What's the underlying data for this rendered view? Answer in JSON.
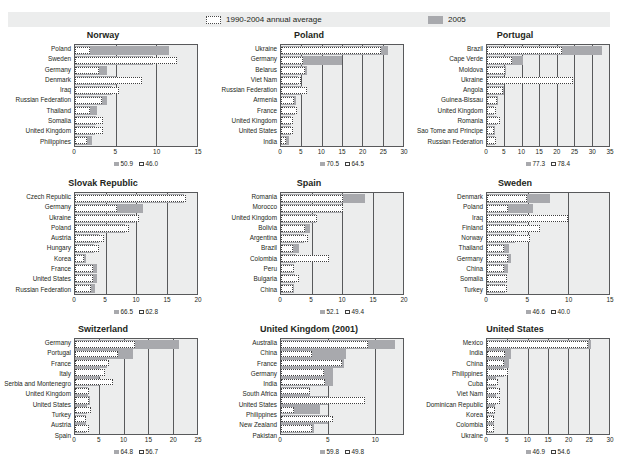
{
  "legend": {
    "series": [
      {
        "key": "avg",
        "label": "1990-2004 annual average",
        "style": "open-dotted",
        "color": "#ffffff"
      },
      {
        "key": "y2005",
        "label": "2005",
        "style": "solid",
        "color": "#a8a9ad"
      }
    ]
  },
  "chart_data": [
    {
      "type": "bar",
      "title": "Norway",
      "orientation": "horizontal",
      "xlabel": "",
      "ylabel": "",
      "xlim": [
        0,
        15
      ],
      "xticks": [
        0,
        5,
        10,
        15
      ],
      "grid": true,
      "legend_position": "top",
      "categories": [
        "Poland",
        "Sweden",
        "Germany",
        "Denmark",
        "Iraq",
        "Russian Federation",
        "Thailand",
        "Somalia",
        "United Kingdom",
        "Philippines"
      ],
      "series": [
        {
          "name": "2005",
          "values": [
            11.6,
            9.6,
            3.9,
            5.1,
            4.5,
            3.9,
            2.7,
            2.6,
            2.4,
            2.1
          ]
        },
        {
          "name": "1990-2004 annual average",
          "values": [
            1.9,
            12.6,
            2.9,
            8.2,
            5.4,
            3.3,
            1.9,
            3.5,
            3.5,
            1.5
          ]
        }
      ],
      "footnote": {
        "solid_value": "50.9",
        "open_value": "46.0"
      }
    },
    {
      "type": "bar",
      "title": "Poland",
      "orientation": "horizontal",
      "xlabel": "",
      "ylabel": "",
      "xlim": [
        0,
        30
      ],
      "xticks": [
        0,
        5,
        10,
        15,
        20,
        25,
        30
      ],
      "grid": true,
      "legend_position": "top",
      "categories": [
        "Ukraine",
        "Germany",
        "Belarus",
        "Viet Nam",
        "Russian Federation",
        "Armenia",
        "France",
        "United Kingdom",
        "United States",
        "India"
      ],
      "series": [
        {
          "name": "2005",
          "values": [
            26.2,
            15.1,
            6.4,
            4.1,
            5.2,
            3.7,
            3.4,
            2.4,
            2.5,
            1.9
          ]
        },
        {
          "name": "1990-2004 annual average",
          "values": [
            24.5,
            5.4,
            6.0,
            4.9,
            6.4,
            3.3,
            4.0,
            3.0,
            2.9,
            1.3
          ]
        }
      ],
      "footnote": {
        "solid_value": "70.5",
        "open_value": "64.5"
      }
    },
    {
      "type": "bar",
      "title": "Portugal",
      "orientation": "horizontal",
      "xlabel": "",
      "ylabel": "",
      "xlim": [
        0,
        35
      ],
      "xticks": [
        0,
        5,
        10,
        15,
        20,
        25,
        30,
        35
      ],
      "grid": true,
      "legend_position": "top",
      "categories": [
        "Brazil",
        "Cape Verde",
        "Moldova",
        "Ukraine",
        "Angola",
        "Guinea-Bissau",
        "United Kingdom",
        "Romania",
        "Sao Tome and Principe",
        "Russian Federation"
      ],
      "series": [
        {
          "name": "2005",
          "values": [
            33.0,
            10.4,
            5.4,
            4.9,
            5.0,
            3.1,
            2.0,
            3.0,
            2.3,
            2.3
          ]
        },
        {
          "name": "1990-2004 annual average",
          "values": [
            21.6,
            7.2,
            5.3,
            24.7,
            4.6,
            2.8,
            2.7,
            3.6,
            2.0,
            2.6
          ]
        }
      ],
      "footnote": {
        "solid_value": "77.3",
        "open_value": "78.4"
      }
    },
    {
      "type": "bar",
      "title": "Slovak Republic",
      "orientation": "horizontal",
      "xlabel": "",
      "ylabel": "",
      "xlim": [
        0,
        20
      ],
      "xticks": [
        0,
        5,
        10,
        15,
        20
      ],
      "grid": true,
      "legend_position": "top",
      "categories": [
        "Czech Republic",
        "Germany",
        "Ukraine",
        "Poland",
        "Austria",
        "Hungary",
        "Korea",
        "France",
        "United States",
        "Russian Federation"
      ],
      "series": [
        {
          "name": "2005",
          "values": [
            17.9,
            11.2,
            9.9,
            8.2,
            4.0,
            3.1,
            1.8,
            3.6,
            3.6,
            3.3
          ]
        },
        {
          "name": "1990-2004 annual average",
          "values": [
            18.2,
            6.9,
            10.5,
            8.9,
            4.8,
            3.9,
            1.5,
            2.9,
            3.0,
            2.6
          ]
        }
      ],
      "footnote": {
        "solid_value": "66.5",
        "open_value": "62.8"
      }
    },
    {
      "type": "bar",
      "title": "Spain",
      "orientation": "horizontal",
      "xlabel": "",
      "ylabel": "",
      "xlim": [
        0,
        20
      ],
      "xticks": [
        0,
        5,
        10,
        15,
        20
      ],
      "grid": true,
      "legend_position": "top",
      "categories": [
        "Romania",
        "Morocco",
        "United Kingdom",
        "Bolivia",
        "Argentina",
        "Brazil",
        "Colombia",
        "Peru",
        "Bulgaria",
        "China"
      ],
      "series": [
        {
          "name": "2005",
          "values": [
            13.8,
            10.0,
            5.8,
            4.7,
            3.7,
            3.0,
            2.4,
            2.2,
            2.3,
            2.2
          ]
        },
        {
          "name": "1990-2004 annual average",
          "values": [
            10.1,
            10.1,
            5.9,
            4.0,
            4.4,
            2.0,
            7.9,
            2.2,
            3.0,
            1.9
          ]
        }
      ],
      "footnote": {
        "solid_value": "52.1",
        "open_value": "49.4"
      }
    },
    {
      "type": "bar",
      "title": "Sweden",
      "orientation": "horizontal",
      "xlabel": "",
      "ylabel": "",
      "xlim": [
        0,
        15
      ],
      "xticks": [
        0,
        5,
        10,
        15
      ],
      "grid": true,
      "legend_position": "top",
      "categories": [
        "Denmark",
        "Poland",
        "Iraq",
        "Finland",
        "Norway",
        "Thailand",
        "Germany",
        "China",
        "Somalia",
        "Turkey"
      ],
      "series": [
        {
          "name": "2005",
          "values": [
            7.7,
            5.6,
            4.9,
            3.6,
            3.5,
            2.7,
            2.9,
            2.6,
            2.4,
            2.2
          ]
        },
        {
          "name": "1990-2004 annual average",
          "values": [
            4.9,
            2.6,
            9.9,
            6.5,
            5.3,
            2.1,
            2.6,
            2.1,
            2.4,
            2.4
          ]
        }
      ],
      "footnote": {
        "solid_value": "46.6",
        "open_value": "40.0"
      }
    },
    {
      "type": "bar",
      "title": "Switzerland",
      "orientation": "horizontal",
      "xlabel": "",
      "ylabel": "",
      "xlim": [
        0,
        25
      ],
      "xticks": [
        0,
        5,
        10,
        15,
        20,
        25
      ],
      "grid": true,
      "legend_position": "top",
      "categories": [
        "Germany",
        "Portugal",
        "France",
        "Italy",
        "Serbia and Montenegro",
        "United Kingdom",
        "United States",
        "Turkey",
        "Austria",
        "Spain"
      ],
      "series": [
        {
          "name": "2005",
          "values": [
            21.4,
            11.8,
            6.5,
            5.1,
            4.9,
            2.7,
            3.0,
            2.4,
            2.2,
            2.3
          ]
        },
        {
          "name": "1990-2004 annual average",
          "values": [
            12.3,
            8.8,
            7.0,
            6.1,
            7.7,
            2.9,
            2.9,
            3.3,
            2.2,
            2.8
          ]
        }
      ],
      "footnote": {
        "solid_value": "64.8",
        "open_value": "56.7"
      }
    },
    {
      "type": "bar",
      "title": "United Kingdom (2001)",
      "orientation": "horizontal",
      "xlabel": "",
      "ylabel": "",
      "xlim": [
        0,
        13
      ],
      "xticks": [
        0,
        5,
        10
      ],
      "grid": true,
      "legend_position": "top",
      "categories": [
        "Australia",
        "China",
        "France",
        "Germany",
        "India",
        "South Africa",
        "United States",
        "Philippines",
        "New Zealand",
        "Pakistan"
      ],
      "series": [
        {
          "name": "2005",
          "values": [
            12.2,
            6.9,
            6.7,
            5.5,
            5.5,
            3.1,
            5.0,
            4.2,
            5.0,
            3.5
          ]
        },
        {
          "name": "1990-2004 annual average",
          "values": [
            9.3,
            3.3,
            6.5,
            4.6,
            4.7,
            3.1,
            9.0,
            1.4,
            5.5,
            3.3
          ]
        }
      ],
      "footnote": {
        "solid_value": "59.8",
        "open_value": "49.8"
      }
    },
    {
      "type": "bar",
      "title": "United States",
      "orientation": "horizontal",
      "xlabel": "",
      "ylabel": "",
      "xlim": [
        0,
        30
      ],
      "xticks": [
        0,
        5,
        10,
        15,
        20,
        25,
        30
      ],
      "grid": true,
      "legend_position": "top",
      "categories": [
        "Mexico",
        "India",
        "China",
        "Philippines",
        "Cuba",
        "Viet Nam",
        "Dominican Republic",
        "Korea",
        "Colombia",
        "Ukraine"
      ],
      "series": [
        {
          "name": "2005",
          "values": [
            25.5,
            6.0,
            5.3,
            4.3,
            2.3,
            2.3,
            2.2,
            1.9,
            1.7,
            1.6
          ]
        },
        {
          "name": "1990-2004 annual average",
          "values": [
            24.9,
            4.4,
            4.2,
            5.1,
            2.7,
            3.2,
            3.1,
            1.9,
            1.6,
            1.8
          ]
        }
      ],
      "footnote": {
        "solid_value": "46.9",
        "open_value": "54.6"
      }
    }
  ]
}
